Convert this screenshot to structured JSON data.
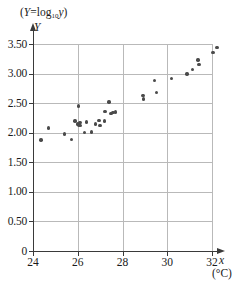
{
  "chart_data": {
    "type": "scatter",
    "title": "",
    "subtitle": "",
    "xlabel": "x",
    "xlabel_units": "(°C)",
    "ylabel": "Y",
    "ylabel_caption_prefix": "(",
    "ylabel_caption_var": "Y",
    "ylabel_caption_eq": "=log",
    "ylabel_caption_sub": "10",
    "ylabel_caption_arg": "y",
    "ylabel_caption_suffix": ")",
    "xlim": [
      24,
      32.8
    ],
    "ylim": [
      0,
      3.6
    ],
    "xticks": [
      24,
      26,
      28,
      30,
      32
    ],
    "xtick_labels": [
      "24",
      "26",
      "28",
      "30",
      "32"
    ],
    "yticks": [
      0,
      0.5,
      1.0,
      1.5,
      2.0,
      2.5,
      3.0,
      3.5
    ],
    "ytick_labels": [
      "0",
      "0.50",
      "1.00",
      "1.50",
      "2.00",
      "2.50",
      "3.00",
      "3.50"
    ],
    "grid": true,
    "grid_color": "#b9b9b9",
    "axis_color": "#3a3a3a",
    "marker_color": "#4a4a4a",
    "legend": null,
    "series": [
      {
        "name": "observations",
        "points": [
          [
            24.35,
            1.88
          ],
          [
            24.68,
            2.08
          ],
          [
            25.42,
            1.98
          ],
          [
            25.72,
            1.89
          ],
          [
            25.88,
            2.2
          ],
          [
            26.02,
            2.45
          ],
          [
            26.0,
            2.15
          ],
          [
            26.05,
            2.13
          ],
          [
            26.1,
            2.17
          ],
          [
            26.12,
            2.12
          ],
          [
            26.3,
            2.0
          ],
          [
            26.4,
            2.18
          ],
          [
            26.62,
            2.01
          ],
          [
            26.78,
            2.15
          ],
          [
            26.95,
            2.21
          ],
          [
            27.0,
            2.12
          ],
          [
            27.2,
            2.2
          ],
          [
            27.22,
            2.36
          ],
          [
            27.4,
            2.52
          ],
          [
            27.48,
            2.33
          ],
          [
            27.58,
            2.34
          ],
          [
            27.7,
            2.35
          ],
          [
            28.92,
            2.63
          ],
          [
            28.95,
            2.57
          ],
          [
            29.42,
            2.88
          ],
          [
            29.52,
            2.68
          ],
          [
            30.18,
            2.92
          ],
          [
            30.88,
            2.99
          ],
          [
            31.12,
            3.07
          ],
          [
            31.38,
            3.23
          ],
          [
            31.42,
            3.15
          ],
          [
            32.05,
            3.36
          ],
          [
            32.22,
            3.44
          ]
        ]
      }
    ]
  }
}
